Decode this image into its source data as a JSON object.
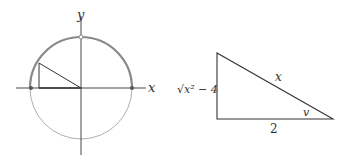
{
  "figure_left": {
    "axis_labels": {
      "x": "x",
      "y": "y"
    },
    "circle": {
      "center": [
        81,
        88
      ],
      "radius": 51
    },
    "colors": {
      "upper_arc": "#8a8a8a",
      "lower_arc": "#9a9a9a",
      "lines": "#333333"
    }
  },
  "figure_right": {
    "labels": {
      "hypotenuse": "x",
      "base": "2",
      "height": "√x² − 4",
      "angle": "v"
    },
    "vertices": {
      "top": [
        217,
        52
      ],
      "bottom_left": [
        217,
        118
      ],
      "bottom_right": [
        333,
        118
      ]
    }
  }
}
